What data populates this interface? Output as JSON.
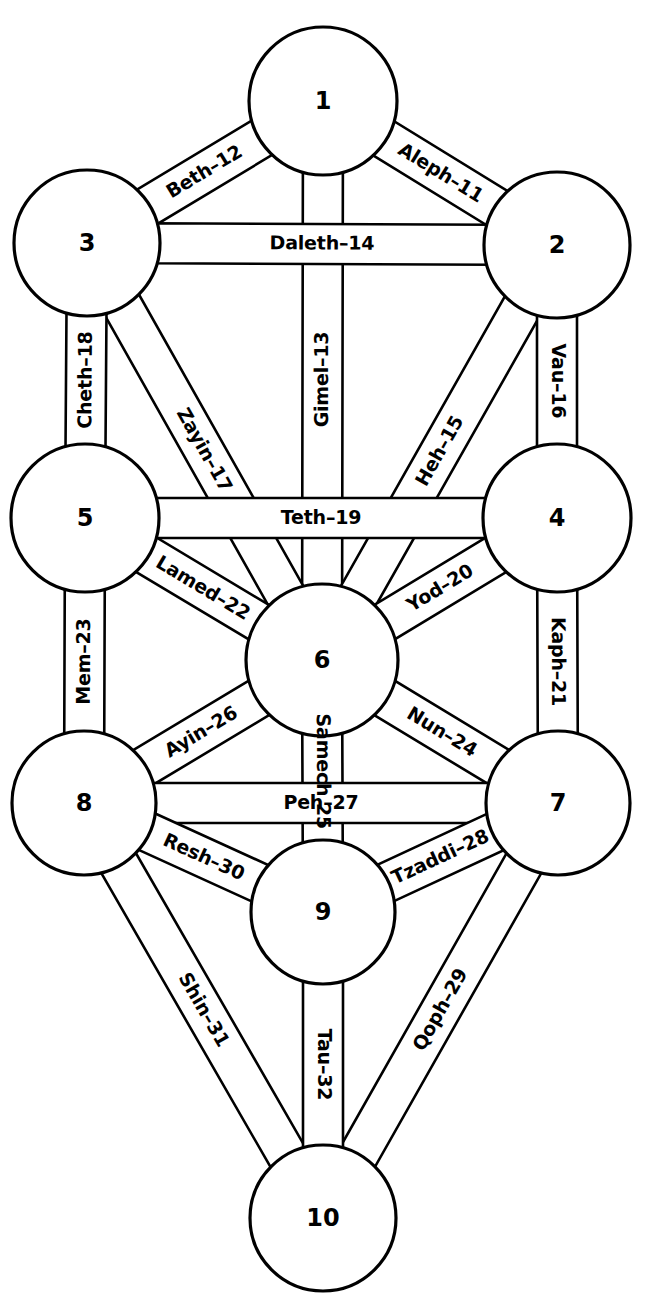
{
  "diagram": {
    "width": 646,
    "height": 1310,
    "background_color": "#ffffff",
    "stroke_color": "#000000",
    "fill_color": "#ffffff"
  },
  "sephiroth": [
    {
      "label": "1",
      "cx": 323,
      "cy": 101,
      "r": 74
    },
    {
      "label": "2",
      "cx": 557,
      "cy": 245,
      "r": 73
    },
    {
      "label": "3",
      "cx": 87,
      "cy": 243,
      "r": 73
    },
    {
      "label": "4",
      "cx": 557,
      "cy": 518,
      "r": 74
    },
    {
      "label": "5",
      "cx": 85,
      "cy": 518,
      "r": 74
    },
    {
      "label": "6",
      "cx": 322,
      "cy": 660,
      "r": 76
    },
    {
      "label": "7",
      "cx": 558,
      "cy": 803,
      "r": 72
    },
    {
      "label": "8",
      "cx": 84,
      "cy": 803,
      "r": 72
    },
    {
      "label": "9",
      "cx": 323,
      "cy": 912,
      "r": 72
    },
    {
      "label": "10",
      "cx": 323,
      "cy": 1218,
      "r": 73
    }
  ],
  "paths": [
    {
      "name": "Aleph-11",
      "label": "Aleph–11",
      "from": "1",
      "to": "2",
      "width": 40,
      "label_mode": "along"
    },
    {
      "name": "Beth-12",
      "label": "Beth–12",
      "from": "1",
      "to": "3",
      "width": 40,
      "label_mode": "along"
    },
    {
      "name": "Gimel-13",
      "label": "Gimel–13",
      "from": "1",
      "to": "6",
      "width": 40,
      "label_mode": "along"
    },
    {
      "name": "Daleth-14",
      "label": "Daleth–14",
      "from": "3",
      "to": "2",
      "width": 40,
      "label_mode": "along"
    },
    {
      "name": "Heh-15",
      "label": "Heh–15",
      "from": "2",
      "to": "6",
      "width": 40,
      "label_mode": "along"
    },
    {
      "name": "Vau-16",
      "label": "Vau–16",
      "from": "2",
      "to": "4",
      "width": 40,
      "label_mode": "along"
    },
    {
      "name": "Zayin-17",
      "label": "Zayin–17",
      "from": "3",
      "to": "6",
      "width": 40,
      "label_mode": "along"
    },
    {
      "name": "Cheth-18",
      "label": "Cheth–18",
      "from": "3",
      "to": "5",
      "width": 40,
      "label_mode": "along"
    },
    {
      "name": "Teth-19",
      "label": "Teth–19",
      "from": "5",
      "to": "4",
      "width": 40,
      "label_mode": "along"
    },
    {
      "name": "Yod-20",
      "label": "Yod–20",
      "from": "4",
      "to": "6",
      "width": 40,
      "label_mode": "along"
    },
    {
      "name": "Kaph-21",
      "label": "Kaph–21",
      "from": "4",
      "to": "7",
      "width": 40,
      "label_mode": "along"
    },
    {
      "name": "Lamed-22",
      "label": "Lamed–22",
      "from": "5",
      "to": "6",
      "width": 40,
      "label_mode": "along"
    },
    {
      "name": "Mem-23",
      "label": "Mem–23",
      "from": "5",
      "to": "8",
      "width": 40,
      "label_mode": "along"
    },
    {
      "name": "Nun-24",
      "label": "Nun–24",
      "from": "6",
      "to": "7",
      "width": 40,
      "label_mode": "along"
    },
    {
      "name": "Samech-25",
      "label": "Samech",
      "label2": "25",
      "from": "6",
      "to": "9",
      "width": 40,
      "label_mode": "split"
    },
    {
      "name": "Ayin-26",
      "label": "Ayin–26",
      "from": "6",
      "to": "8",
      "width": 40,
      "label_mode": "along"
    },
    {
      "name": "Peh-27",
      "label": "Peh–27",
      "from": "8",
      "to": "7",
      "width": 40,
      "label_mode": "along"
    },
    {
      "name": "Tzaddi-28",
      "label": "Tzaddi–28",
      "from": "7",
      "to": "9",
      "width": 40,
      "label_mode": "along"
    },
    {
      "name": "Qoph-29",
      "label": "Qoph–29",
      "from": "7",
      "to": "10",
      "width": 40,
      "label_mode": "along"
    },
    {
      "name": "Resh-30",
      "label": "Resh–30",
      "from": "8",
      "to": "9",
      "width": 40,
      "label_mode": "along"
    },
    {
      "name": "Shin-31",
      "label": "Shin–31",
      "from": "8",
      "to": "10",
      "width": 40,
      "label_mode": "along"
    },
    {
      "name": "Tau-32",
      "label": "Tau–32",
      "from": "9",
      "to": "10",
      "width": 40,
      "label_mode": "along"
    }
  ]
}
